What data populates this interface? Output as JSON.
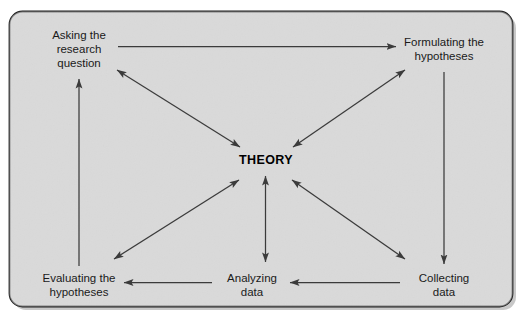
{
  "figure": {
    "kind": "research-cycle-diagram",
    "center": {
      "label": "THEORY"
    },
    "nodes": [
      {
        "id": "asking",
        "label_line1": "Asking the",
        "label_line2": "research",
        "label_line3": "question"
      },
      {
        "id": "formulating",
        "label_line1": "Formulating the",
        "label_line2": "hypotheses",
        "label_line3": ""
      },
      {
        "id": "collecting",
        "label_line1": "Collecting",
        "label_line2": "data",
        "label_line3": ""
      },
      {
        "id": "analyzing",
        "label_line1": "Analyzing",
        "label_line2": "data",
        "label_line3": ""
      },
      {
        "id": "evaluating",
        "label_line1": "Evaluating the",
        "label_line2": "hypotheses",
        "label_line3": ""
      }
    ],
    "connections": [
      {
        "from": "asking",
        "to": "formulating",
        "style": "single"
      },
      {
        "from": "formulating",
        "to": "collecting",
        "style": "single"
      },
      {
        "from": "collecting",
        "to": "analyzing",
        "style": "single"
      },
      {
        "from": "analyzing",
        "to": "evaluating",
        "style": "single"
      },
      {
        "from": "evaluating",
        "to": "asking",
        "style": "single"
      },
      {
        "from": "asking",
        "to": "center",
        "style": "double"
      },
      {
        "from": "formulating",
        "to": "center",
        "style": "double"
      },
      {
        "from": "collecting",
        "to": "center",
        "style": "double"
      },
      {
        "from": "analyzing",
        "to": "center",
        "style": "double"
      },
      {
        "from": "evaluating",
        "to": "center",
        "style": "double"
      }
    ],
    "colors": {
      "panel_fill": "#dcdcdc",
      "panel_border": "#1d1d1d",
      "line": "#3b3b3b",
      "text": "#1a1a1a",
      "page_background": "#ffffff"
    }
  }
}
